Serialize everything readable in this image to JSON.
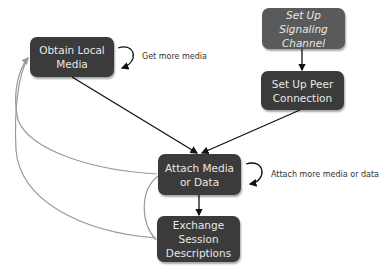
{
  "diagram": {
    "nodes": [
      {
        "id": "obtain",
        "label": "Obtain Local Media"
      },
      {
        "id": "signaling",
        "label": "Set Up Signaling Channel"
      },
      {
        "id": "peer",
        "label": "Set Up Peer Connection"
      },
      {
        "id": "attach",
        "label": "Attach Media or Data"
      },
      {
        "id": "exchange",
        "label": "Exchange Session Descriptions"
      }
    ],
    "loops": [
      {
        "node": "obtain",
        "label": "Get more media"
      },
      {
        "node": "attach",
        "label": "Attach more media or data"
      }
    ],
    "edges": [
      {
        "from": "signaling",
        "to": "peer",
        "style": "black"
      },
      {
        "from": "obtain",
        "to": "attach",
        "style": "black"
      },
      {
        "from": "peer",
        "to": "attach",
        "style": "black"
      },
      {
        "from": "attach",
        "to": "exchange",
        "style": "black"
      },
      {
        "from": "attach",
        "to": "obtain",
        "style": "gray"
      },
      {
        "from": "exchange",
        "to": "obtain",
        "style": "gray"
      },
      {
        "from": "exchange",
        "to": "attach",
        "style": "gray"
      }
    ],
    "colors": {
      "node_dark": "#3b3b3b",
      "node_mid": "#5a5a5a",
      "edge": "#111111",
      "edge_gray": "#9a9a9a"
    }
  }
}
